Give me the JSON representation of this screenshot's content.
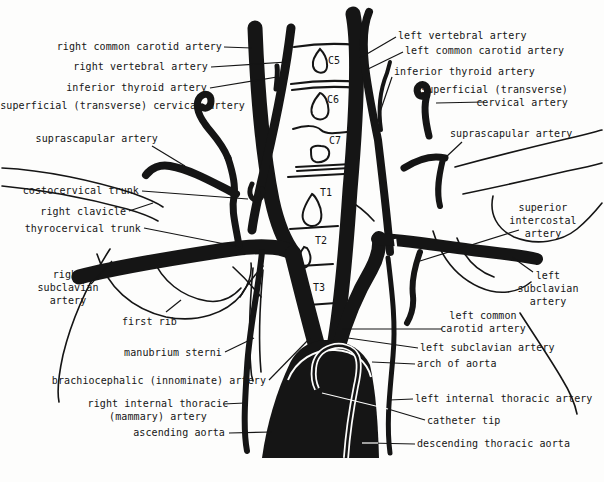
{
  "figure": {
    "width": 604,
    "height": 482,
    "background": "#fdfdfc",
    "ink_color": "#151515",
    "paper_color": "#ffffff"
  },
  "vertebrae": [
    {
      "text": "C5",
      "x": 328,
      "y": 55
    },
    {
      "text": "C6",
      "x": 327,
      "y": 94
    },
    {
      "text": "C7",
      "x": 329,
      "y": 135
    },
    {
      "text": "T1",
      "x": 320,
      "y": 187
    },
    {
      "text": "T2",
      "x": 315,
      "y": 235
    },
    {
      "text": "T3",
      "x": 313,
      "y": 282
    }
  ],
  "labels": [
    {
      "id": "right-common-carotid-artery",
      "lines": [
        "right common carotid artery"
      ],
      "align": "right",
      "x": 222,
      "top": 41,
      "leader": [
        224,
        47,
        252,
        48
      ]
    },
    {
      "id": "right-vertebral-artery",
      "lines": [
        "right vertebral artery"
      ],
      "align": "right",
      "x": 208,
      "top": 61,
      "leader": [
        211,
        67,
        287,
        62
      ]
    },
    {
      "id": "inferior-thyroid-artery-right",
      "lines": [
        "inferior thyroid artery"
      ],
      "align": "right",
      "x": 207,
      "top": 82,
      "leader": [
        210,
        88,
        277,
        77
      ]
    },
    {
      "id": "superficial-transverse-cervical-artery-right",
      "lines": [
        "superficial (transverse) cervical artery"
      ],
      "align": "right",
      "x": 245,
      "top": 100,
      "leader": [
        196,
        112,
        206,
        126
      ]
    },
    {
      "id": "suprascapular-artery-right",
      "lines": [
        "suprascapular artery"
      ],
      "align": "right",
      "x": 158,
      "top": 133,
      "leader": [
        152,
        146,
        185,
        166
      ]
    },
    {
      "id": "costocervical-trunk",
      "lines": [
        "costocervical trunk"
      ],
      "align": "right",
      "x": 139,
      "top": 185,
      "leader": [
        142,
        191,
        248,
        199
      ]
    },
    {
      "id": "right-clavicle",
      "lines": [
        "right clavicle"
      ],
      "align": "right",
      "x": 126,
      "top": 206,
      "leader": [
        129,
        211,
        153,
        203
      ]
    },
    {
      "id": "thyrocervical-trunk",
      "lines": [
        "thyrocervical trunk"
      ],
      "align": "right",
      "x": 141,
      "top": 223,
      "leader": [
        144,
        228,
        240,
        247
      ]
    },
    {
      "id": "right-subclavian-artery",
      "lines": [
        "right",
        "subclavian",
        "artery"
      ],
      "align": "center",
      "x": 68,
      "top": 269,
      "leader": [
        91,
        284,
        112,
        261
      ]
    },
    {
      "id": "first-rib",
      "lines": [
        "first rib"
      ],
      "align": "right",
      "x": 177,
      "top": 316,
      "leader": [
        166,
        312,
        181,
        300
      ]
    },
    {
      "id": "manubrium-sterni",
      "lines": [
        "manubrium sterni"
      ],
      "align": "right",
      "x": 222,
      "top": 347,
      "leader": [
        225,
        352,
        254,
        338
      ]
    },
    {
      "id": "brachiocephalic-innominate-artery",
      "lines": [
        "brachiocephalic (innominate) artery"
      ],
      "align": "right",
      "x": 266,
      "top": 375,
      "leader": [
        269,
        380,
        310,
        338
      ]
    },
    {
      "id": "right-internal-thoracic-mammary-artery",
      "lines": [
        "right internal thoracic",
        "(mammary) artery"
      ],
      "align": "center",
      "x": 158,
      "top": 398,
      "leader": [
        223,
        404,
        245,
        403
      ]
    },
    {
      "id": "ascending-aorta",
      "lines": [
        "ascending aorta"
      ],
      "align": "right",
      "x": 225,
      "top": 427,
      "leader": [
        229,
        433,
        272,
        432
      ]
    },
    {
      "id": "left-vertebral-artery",
      "lines": [
        "left vertebral artery"
      ],
      "align": "left",
      "x": 398,
      "top": 30,
      "leader": [
        396,
        37,
        360,
        58
      ]
    },
    {
      "id": "left-common-carotid-artery-top",
      "lines": [
        "left common carotid artery"
      ],
      "align": "left",
      "x": 405,
      "top": 45,
      "leader": [
        403,
        52,
        366,
        70
      ]
    },
    {
      "id": "inferior-thyroid-artery-left",
      "lines": [
        "inferior thyroid artery"
      ],
      "align": "left",
      "x": 394,
      "top": 66,
      "leader": [
        392,
        77,
        380,
        112
      ]
    },
    {
      "id": "superficial-transverse-cervical-artery-left",
      "lines": [
        "superficial (transverse)",
        "cervical artery"
      ],
      "align": "right",
      "x": 568,
      "top": 84,
      "leader": [
        484,
        102,
        436,
        103
      ]
    },
    {
      "id": "suprascapular-artery-left",
      "lines": [
        "suprascapular artery"
      ],
      "align": "left",
      "x": 450,
      "top": 128,
      "leader": [
        462,
        142,
        445,
        158
      ]
    },
    {
      "id": "superior-intercostal-artery",
      "lines": [
        "superior",
        "intercostal",
        "artery"
      ],
      "align": "center",
      "x": 543,
      "top": 202,
      "leader": [
        519,
        230,
        420,
        261
      ]
    },
    {
      "id": "left-subclavian-artery-lateral",
      "lines": [
        "left",
        "subclavian",
        "artery"
      ],
      "align": "center",
      "x": 548,
      "top": 270,
      "leader": [
        533,
        272,
        512,
        257
      ]
    },
    {
      "id": "left-common-carotid-artery-bottom",
      "lines": [
        "left common",
        "carotid artery"
      ],
      "align": "center",
      "x": 483,
      "top": 310,
      "leader": [
        442,
        329,
        342,
        329
      ]
    },
    {
      "id": "left-subclavian-artery-origin",
      "lines": [
        "left subclavian artery"
      ],
      "align": "left",
      "x": 420,
      "top": 342,
      "leader": [
        418,
        348,
        348,
        338
      ]
    },
    {
      "id": "arch-of-aorta",
      "lines": [
        "arch of aorta"
      ],
      "align": "left",
      "x": 417,
      "top": 358,
      "leader": [
        415,
        364,
        372,
        362
      ]
    },
    {
      "id": "left-internal-thoracic-artery",
      "lines": [
        "left internal thoracic artery"
      ],
      "align": "left",
      "x": 415,
      "top": 393,
      "leader": [
        413,
        399,
        389,
        400
      ]
    },
    {
      "id": "catheter-tip",
      "lines": [
        "catheter tip"
      ],
      "align": "left",
      "x": 427,
      "top": 415,
      "leader": [
        425,
        420,
        388,
        409
      ],
      "leader_white": [
        388,
        409,
        322,
        393
      ]
    },
    {
      "id": "descending-thoracic-aorta",
      "lines": [
        "descending thoracic aorta"
      ],
      "align": "left",
      "x": 417,
      "top": 438,
      "leader": [
        415,
        444,
        368,
        443
      ],
      "leader_white": [
        378,
        443,
        362,
        443
      ]
    }
  ]
}
